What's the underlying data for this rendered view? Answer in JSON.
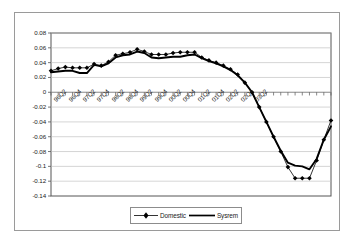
{
  "chart_data": {
    "type": "line",
    "title": "",
    "xlabel": "",
    "ylabel": "",
    "ylim": [
      -0.14,
      0.08
    ],
    "ytick_step": 0.02,
    "yticks": [
      0.08,
      0.06,
      0.04,
      0.02,
      0,
      -0.02,
      -0.04,
      -0.06,
      -0.08,
      -0.1,
      -0.12,
      -0.14
    ],
    "ytick_labels": [
      "0.08",
      "0.06",
      "0.04",
      "0.02",
      "0",
      "-0.02",
      "-0.04",
      "-0.06",
      "-0.08",
      "-0.1",
      "-0.12",
      "-0.14"
    ],
    "grid": true,
    "grid_axis": "y",
    "legend_position": "bottom",
    "x": [
      "96Q1",
      "96Q2",
      "96Q3",
      "96Q4",
      "97Q1",
      "97Q2",
      "97Q3",
      "97Q4",
      "98Q1",
      "98Q2",
      "98Q3",
      "98Q4",
      "99Q1",
      "99Q2",
      "99Q3",
      "99Q4",
      "00Q1",
      "00Q2",
      "00Q3",
      "00Q4",
      "01Q1",
      "01Q2",
      "01Q3",
      "01Q4",
      "02Q1",
      "02Q2",
      "02Q3",
      "02Q4",
      "03Q1",
      "03Q2",
      "03Q3"
    ],
    "xtick_labels_shown": [
      "96Q2",
      "96Q4",
      "97Q2",
      "97Q4",
      "98Q2",
      "98Q4",
      "99Q2",
      "99Q4",
      "00Q2",
      "00Q4",
      "01Q2",
      "01Q4",
      "02Q2",
      "02Q4",
      "03Q2"
    ],
    "xtick_label_indices": [
      1,
      3,
      5,
      7,
      9,
      11,
      13,
      15,
      17,
      19,
      21,
      23,
      25,
      27,
      29
    ],
    "series": [
      {
        "name": "Domestic",
        "marker": "diamond",
        "color": "#000000",
        "values": [
          0.029,
          0.032,
          0.034,
          0.033,
          0.033,
          0.033,
          0.038,
          0.036,
          0.041,
          0.05,
          0.052,
          0.054,
          0.058,
          0.055,
          0.051,
          0.051,
          0.051,
          0.053,
          0.054,
          0.054,
          0.054,
          0.047,
          0.043,
          0.04,
          0.036,
          0.031,
          0.024,
          0.013,
          0.0,
          -0.02,
          -0.04
        ]
      },
      {
        "name": "Sysrem",
        "marker": "none",
        "color": "#000000",
        "values": [
          0.027,
          0.028,
          0.029,
          0.029,
          0.026,
          0.026,
          0.037,
          0.035,
          0.039,
          0.047,
          0.05,
          0.051,
          0.055,
          0.053,
          0.047,
          0.046,
          0.047,
          0.048,
          0.048,
          0.05,
          0.051,
          0.046,
          0.042,
          0.039,
          0.035,
          0.03,
          0.023,
          0.013,
          0.0,
          -0.02,
          -0.04
        ]
      }
    ],
    "domestic_tail": [
      -0.06,
      -0.08,
      -0.101,
      -0.116,
      -0.116,
      -0.116,
      -0.092,
      -0.064,
      -0.038
    ],
    "system_tail": [
      -0.06,
      -0.079,
      -0.095,
      -0.099,
      -0.1,
      -0.104,
      -0.09,
      -0.064,
      -0.046
    ],
    "legend": [
      "Domestic",
      "Sysrem"
    ]
  },
  "legend": {
    "entries": [
      {
        "label": "Domestic"
      },
      {
        "label": "Sysrem"
      }
    ]
  }
}
